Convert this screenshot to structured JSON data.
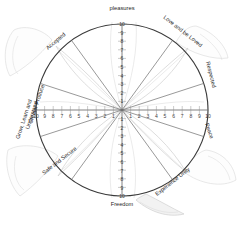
{
  "diagram": {
    "center": {
      "x": 122,
      "y": 110
    },
    "radius": 86,
    "ring_color": "#3a3a3a",
    "spoke_color": "#6d6d6d",
    "background_color": "#ffffff"
  },
  "scales": {
    "max": 10,
    "up_labels": [
      "10",
      "9",
      "8",
      "7",
      "6",
      "5",
      "4",
      "3",
      "2",
      "1"
    ],
    "down_labels": [
      "1",
      "2",
      "3",
      "4",
      "5",
      "6",
      "7",
      "8",
      "9",
      "10"
    ],
    "left_labels": [
      "10",
      "9",
      "8",
      "7",
      "6",
      "5",
      "4",
      "3",
      "2",
      "1"
    ],
    "right_labels": [
      "1",
      "2",
      "3",
      "4",
      "5",
      "6",
      "7",
      "8",
      "9",
      "10"
    ]
  },
  "spokes": [
    {
      "id": "pleasures",
      "label": "pleasures",
      "angle_deg": 90,
      "label_pos": "top"
    },
    {
      "id": "love-and-be-loved",
      "label": "Love and be Loved",
      "angle_deg": 54,
      "label_pos": "upper-right"
    },
    {
      "id": "respected",
      "label": "Respected",
      "angle_deg": 18,
      "label_pos": "right-upper"
    },
    {
      "id": "peace",
      "label": "Peace",
      "angle_deg": -18,
      "label_pos": "right-lower"
    },
    {
      "id": "experience-unity",
      "label": "Experience Unity",
      "angle_deg": -54,
      "label_pos": "lower-right"
    },
    {
      "id": "freedom",
      "label": "Freedom",
      "angle_deg": -90,
      "label_pos": "bottom"
    },
    {
      "id": "safe-and-secure",
      "label": "Safe and Secure",
      "angle_deg": -126,
      "label_pos": "lower-left"
    },
    {
      "id": "create-produce",
      "label": "Create/ Produce",
      "angle_deg": -162,
      "label_pos": "left-lower"
    },
    {
      "id": "grow-learn",
      "label": "Grow, Learn and Understand",
      "angle_deg": 162,
      "label_pos": "left-upper"
    },
    {
      "id": "accepted",
      "label": "Accepted",
      "angle_deg": 126,
      "label_pos": "upper-left"
    }
  ],
  "labels": {
    "grow_learn_line1": "Grow, Learn and",
    "grow_learn_line2": "Understand",
    "create_produce": "Create/ Produce"
  }
}
